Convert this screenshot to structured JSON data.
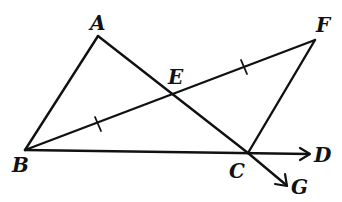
{
  "figure": {
    "type": "geometry-diagram",
    "points": {
      "A": "A",
      "B": "B",
      "C": "C",
      "D": "D",
      "E": "E",
      "F": "F",
      "G": "G"
    },
    "segments": [
      "AB",
      "AC",
      "BF",
      "CF",
      "BC"
    ],
    "rays": [
      "BD",
      "AG"
    ],
    "intersections": [
      {
        "point": "E",
        "of": [
          "AC",
          "BF"
        ]
      }
    ],
    "equal_marks": [
      {
        "segments": [
          "BE",
          "EF"
        ],
        "ticks": 1
      }
    ],
    "collinear": [
      [
        "B",
        "C",
        "D"
      ],
      [
        "A",
        "E",
        "C",
        "G"
      ],
      [
        "B",
        "E",
        "F"
      ]
    ],
    "colors": {
      "ink": "#111111",
      "background": "#ffffff"
    }
  }
}
